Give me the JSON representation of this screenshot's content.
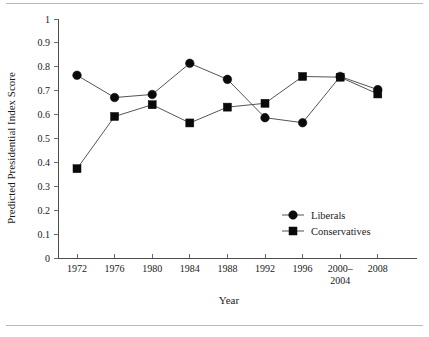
{
  "chart_data": {
    "type": "line",
    "title": "",
    "xlabel": "Year",
    "ylabel": "Predicted Presidential Index Score",
    "categories": [
      "1972",
      "1976",
      "1980",
      "1984",
      "1988",
      "1992",
      "1996",
      "2000–\n2004",
      "2008"
    ],
    "category_labels": [
      {
        "line1": "1972",
        "line2": ""
      },
      {
        "line1": "1976",
        "line2": ""
      },
      {
        "line1": "1980",
        "line2": ""
      },
      {
        "line1": "1984",
        "line2": ""
      },
      {
        "line1": "1988",
        "line2": ""
      },
      {
        "line1": "1992",
        "line2": ""
      },
      {
        "line1": "1996",
        "line2": ""
      },
      {
        "line1": "2000–",
        "line2": "2004"
      },
      {
        "line1": "2008",
        "line2": ""
      }
    ],
    "ylim": [
      0,
      1
    ],
    "yticks": [
      "0",
      "0.1",
      "0.2",
      "0.3",
      "0.4",
      "0.5",
      "0.6",
      "0.7",
      "0.8",
      "0.9",
      "1"
    ],
    "ytick_values": [
      0,
      0.1,
      0.2,
      0.3,
      0.4,
      0.5,
      0.6,
      0.7,
      0.8,
      0.9,
      1
    ],
    "grid": false,
    "legend_position": "inside-lower-right",
    "series": [
      {
        "name": "Liberals",
        "marker": "circle",
        "color": "#0a0a0a",
        "values": [
          0.765,
          0.672,
          0.685,
          0.815,
          0.748,
          0.588,
          0.567,
          0.76,
          0.705
        ]
      },
      {
        "name": "Conservatives",
        "marker": "square",
        "color": "#0a0a0a",
        "values": [
          0.375,
          0.593,
          0.642,
          0.566,
          0.632,
          0.648,
          0.76,
          0.757,
          0.687
        ]
      }
    ]
  },
  "figure": {
    "top_rule": "",
    "bottom_rule": ""
  }
}
